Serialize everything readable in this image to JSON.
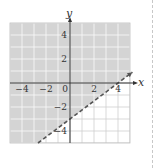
{
  "chart_data": {
    "type": "line",
    "title": "",
    "xlabel": "x",
    "ylabel": "y",
    "xlim": [
      -5,
      5
    ],
    "ylim": [
      -5,
      5
    ],
    "grid": true,
    "x_ticks": [
      {
        "value": -4,
        "label": "−4"
      },
      {
        "value": -2,
        "label": "−2"
      },
      {
        "value": 0,
        "label": "0"
      },
      {
        "value": 2,
        "label": "2"
      },
      {
        "value": 4,
        "label": "4"
      }
    ],
    "y_ticks": [
      {
        "value": 4,
        "label": "4"
      },
      {
        "value": 2,
        "label": "2"
      },
      {
        "value": -2,
        "label": "−2"
      },
      {
        "value": -4,
        "label": "−4"
      }
    ],
    "boundary_line": {
      "equation": "y = 0.75x - 3",
      "slope": 0.75,
      "intercept": -3,
      "style": "dashed",
      "points": [
        [
          0,
          -3
        ],
        [
          4,
          0
        ]
      ]
    },
    "shaded_region": "above",
    "inequality": "y > 0.75x - 3",
    "colors": {
      "shade": "#d4d4d4",
      "grid": "#ffffff",
      "unshaded_grid": "#cfcfcf",
      "axis": "#333333",
      "line": "#555555"
    }
  }
}
